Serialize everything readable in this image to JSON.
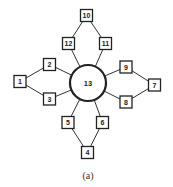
{
  "diagram": {
    "caption": "(a)",
    "hub": {
      "id": "13",
      "label": "13",
      "cx": 88,
      "cy": 83,
      "r": 18
    },
    "nodes": [
      {
        "id": "1",
        "label": "1",
        "cx": 20,
        "cy": 81.5
      },
      {
        "id": "2",
        "label": "2",
        "cx": 49.5,
        "cy": 64.5
      },
      {
        "id": "3",
        "label": "3",
        "cx": 49.5,
        "cy": 99
      },
      {
        "id": "4",
        "label": "4",
        "cx": 87.5,
        "cy": 152.5
      },
      {
        "id": "5",
        "label": "5",
        "cx": 68,
        "cy": 122.5
      },
      {
        "id": "6",
        "label": "6",
        "cx": 102.5,
        "cy": 122.5
      },
      {
        "id": "7",
        "label": "7",
        "cx": 154.5,
        "cy": 85
      },
      {
        "id": "8",
        "label": "8",
        "cx": 126,
        "cy": 102
      },
      {
        "id": "9",
        "label": "9",
        "cx": 126,
        "cy": 67
      },
      {
        "id": "10",
        "label": "10",
        "cx": 86.5,
        "cy": 15.5
      },
      {
        "id": "11",
        "label": "11",
        "cx": 105.5,
        "cy": 43.5
      },
      {
        "id": "12",
        "label": "12",
        "cx": 68.5,
        "cy": 43.5
      }
    ],
    "edges": [
      [
        "1",
        "2"
      ],
      [
        "1",
        "3"
      ],
      [
        "2",
        "13"
      ],
      [
        "3",
        "13"
      ],
      [
        "4",
        "5"
      ],
      [
        "4",
        "6"
      ],
      [
        "5",
        "13"
      ],
      [
        "6",
        "13"
      ],
      [
        "7",
        "9"
      ],
      [
        "7",
        "8"
      ],
      [
        "9",
        "13"
      ],
      [
        "8",
        "13"
      ],
      [
        "10",
        "12"
      ],
      [
        "10",
        "11"
      ],
      [
        "12",
        "13"
      ],
      [
        "11",
        "13"
      ]
    ]
  }
}
